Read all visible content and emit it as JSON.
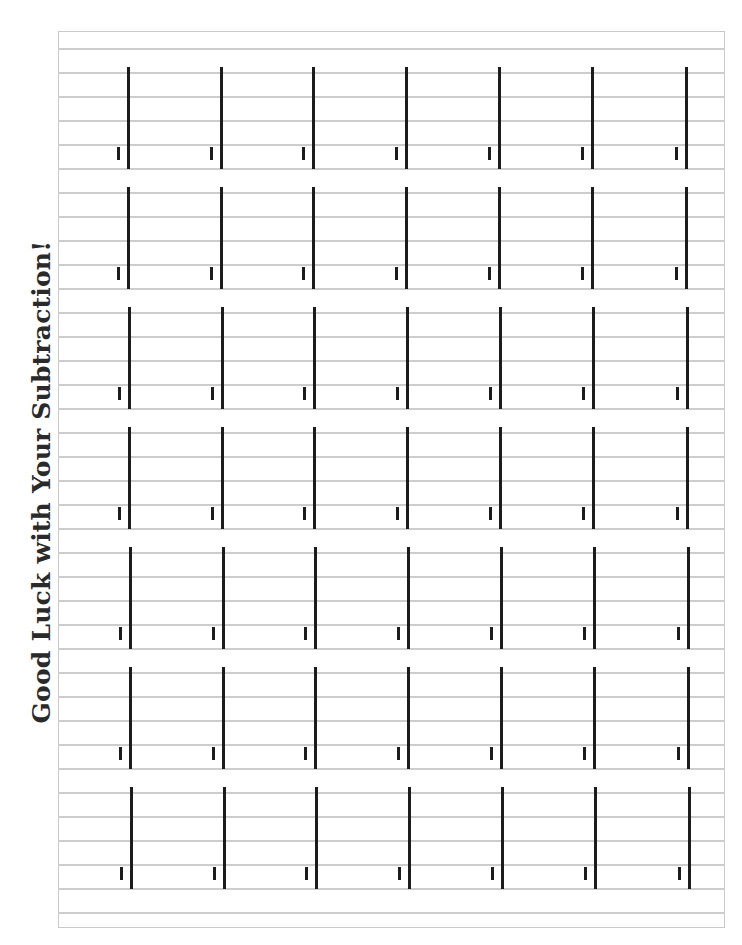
{
  "worksheet": {
    "title": "Good Luck with Your Subtraction!",
    "type": "subtraction practice grid",
    "rows": 7,
    "columns": 7,
    "lines_per_row": 5
  },
  "layout": {
    "frame": {
      "left": 58,
      "top": 31,
      "right": 725,
      "bottom": 928
    },
    "first_line_y": 49,
    "line_spacing": 24,
    "line_count": 37,
    "row_period": 120,
    "first_bar_top": 67,
    "bar_height": 102,
    "column_x": [
      128,
      221,
      313,
      406,
      499,
      592,
      686
    ],
    "row_x_shift_per_row": 0.45,
    "tick_offset_x": -10,
    "tick_offset_y": 80
  },
  "colors": {
    "ruling_line": "#cdcdcd",
    "frame": "#c9c9c9",
    "bar": "#1c1c1c",
    "title": "#2a2a2a",
    "background": "#ffffff"
  }
}
